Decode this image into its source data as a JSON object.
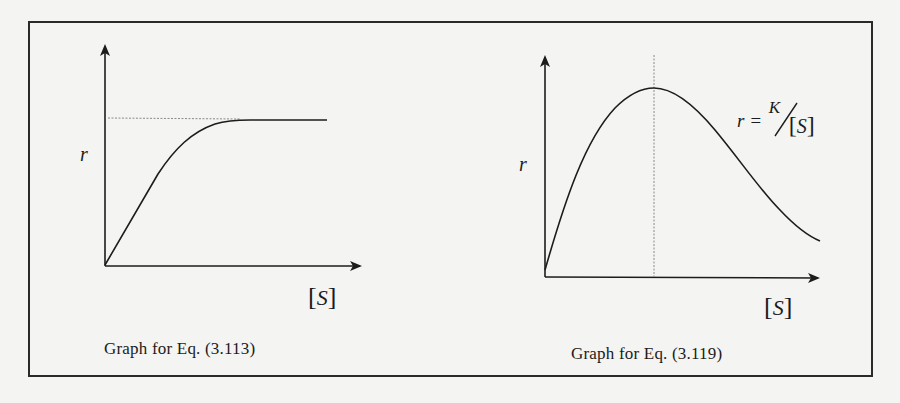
{
  "figure": {
    "panels": [
      {
        "id": "left",
        "y_label": "r",
        "x_label_open": "[",
        "x_label_var": "S",
        "x_label_close": "]",
        "caption": "Graph for Eq. (3.113)",
        "curve_type": "saturating (rises then plateaus)",
        "reference_line": "horizontal dotted line at plateau level"
      },
      {
        "id": "right",
        "y_label": "r",
        "x_label_open": "[",
        "x_label_var": "S",
        "x_label_close": "]",
        "caption": "Graph for Eq. (3.119)",
        "curve_type": "peaked (rises to maximum then decays)",
        "reference_line": "vertical dotted line at peak",
        "annotation": {
          "lhs": "r =",
          "numerator": "K",
          "denominator_open": "[",
          "denominator_var": "S",
          "denominator_close": "]"
        }
      }
    ]
  },
  "colors": {
    "ink": "#1c1c1c",
    "background": "#f4f4f2",
    "guide": "#8a8a8a"
  }
}
